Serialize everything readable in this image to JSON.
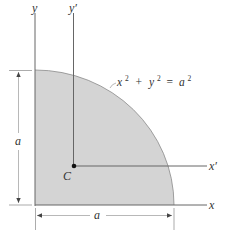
{
  "figure": {
    "type": "quarter-circle area centroid diagram",
    "region": "quarter circle in first quadrant",
    "fill_color": "#d4d4d4",
    "axis_color": "#666666"
  },
  "labels": {
    "y_axis": "y",
    "y_prime_axis": "y′",
    "x_axis": "x",
    "x_prime_axis": "x′",
    "centroid": "C",
    "equation": "x² + y² = a²",
    "dim_vertical": "a",
    "dim_horizontal": "a"
  },
  "equation_parts": {
    "x": "x",
    "x_exp": "2",
    "plus": "+",
    "y": "y",
    "y_exp": "2",
    "equals": "=",
    "a": "a",
    "a_exp": "2"
  }
}
